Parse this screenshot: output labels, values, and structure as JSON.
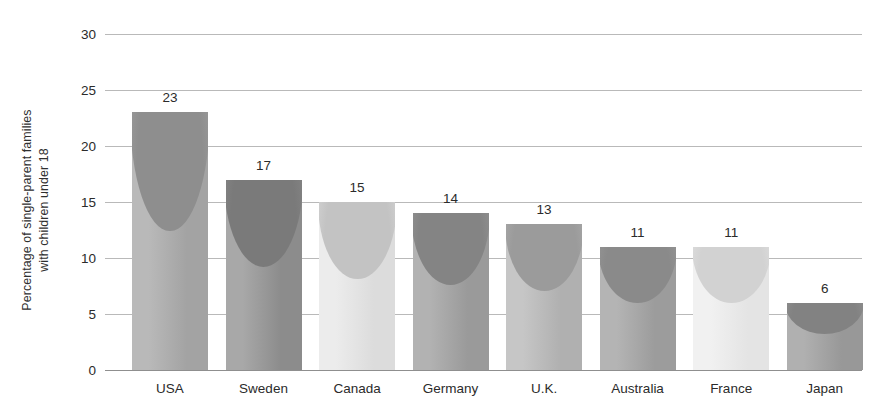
{
  "chart_data": {
    "type": "bar",
    "title": "",
    "xlabel": "",
    "ylabel": "Percentage of single-parent families with children under 18",
    "ylabel_line1": "Percentage of single-parent families",
    "ylabel_line2": "with children under 18",
    "ylim": [
      0,
      30
    ],
    "ytick_values": [
      0,
      5,
      10,
      15,
      20,
      25,
      30
    ],
    "ytick_labels": [
      "0",
      "5",
      "10",
      "15",
      "20",
      "25",
      "30"
    ],
    "grid": true,
    "grid_axis": "y",
    "legend": "none",
    "categories": [
      "USA",
      "Sweden",
      "Canada",
      "Germany",
      "U.K.",
      "Australia",
      "France",
      "Japan"
    ],
    "values": [
      23,
      17,
      15,
      14,
      13,
      11,
      11,
      6
    ],
    "value_labels": [
      "23",
      "17",
      "15",
      "14",
      "13",
      "11",
      "11",
      "6"
    ],
    "bars": [
      {
        "category": "USA",
        "value": 23,
        "label": "23",
        "fill_top": "#b9b9b9",
        "fill_bottom": "#a3a3a3",
        "cap": "#8e8e8e"
      },
      {
        "category": "Sweden",
        "value": 17,
        "label": "17",
        "fill_top": "#a8a8a8",
        "fill_bottom": "#8c8c8c",
        "cap": "#7a7a7a"
      },
      {
        "category": "Canada",
        "value": 15,
        "label": "15",
        "fill_top": "#ececec",
        "fill_bottom": "#dcdcdc",
        "cap": "#c3c3c3"
      },
      {
        "category": "Germany",
        "value": 14,
        "label": "14",
        "fill_top": "#b2b2b2",
        "fill_bottom": "#9a9a9a",
        "cap": "#848484"
      },
      {
        "category": "U.K.",
        "value": 13,
        "label": "13",
        "fill_top": "#c6c6c6",
        "fill_bottom": "#b0b0b0",
        "cap": "#9b9b9b"
      },
      {
        "category": "Australia",
        "value": 11,
        "label": "11",
        "fill_top": "#b4b4b4",
        "fill_bottom": "#9c9c9c",
        "cap": "#8a8a8a"
      },
      {
        "category": "France",
        "value": 11,
        "label": "11",
        "fill_top": "#f1f1f1",
        "fill_bottom": "#e4e4e4",
        "cap": "#d2d2d2"
      },
      {
        "category": "Japan",
        "value": 6,
        "label": "6",
        "fill_top": "#b0b0b0",
        "fill_bottom": "#989898",
        "cap": "#828282"
      }
    ]
  },
  "colors": {
    "background": "#ffffff",
    "gridline": "#b9b9b9",
    "axis": "#8f8f8f",
    "text": "#2b2b2b"
  }
}
